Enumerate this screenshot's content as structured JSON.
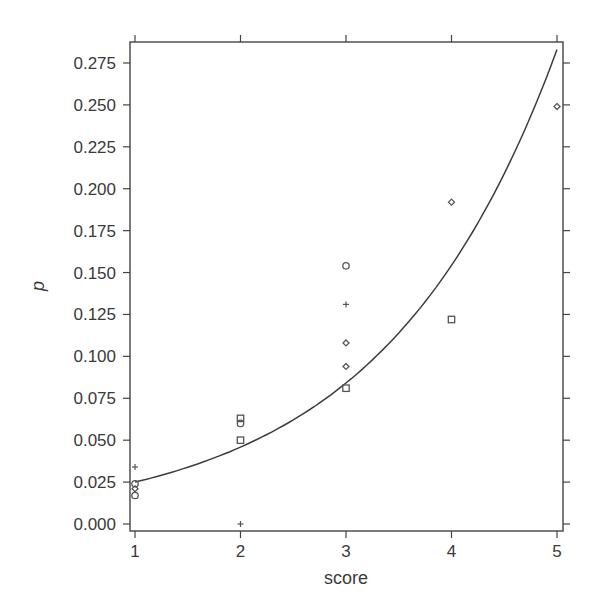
{
  "chart_data": {
    "type": "scatter",
    "title": "",
    "xlabel": "score",
    "ylabel": "p",
    "xlim": [
      0.97,
      5.05
    ],
    "ylim": [
      -0.004,
      0.288
    ],
    "x_ticks": [
      1,
      2,
      3,
      4,
      5
    ],
    "x_tick_labels": [
      "1",
      "2",
      "3",
      "4",
      "5"
    ],
    "y_ticks": [
      0.0,
      0.025,
      0.05,
      0.075,
      0.1,
      0.125,
      0.15,
      0.175,
      0.2,
      0.225,
      0.25,
      0.275
    ],
    "y_tick_labels": [
      "0.000",
      "0.025",
      "0.050",
      "0.075",
      "0.100",
      "0.125",
      "0.150",
      "0.175",
      "0.200",
      "0.225",
      "0.250",
      "0.275"
    ],
    "grid": false,
    "legend": null,
    "series": [
      {
        "name": "plus",
        "marker": "plus",
        "points": [
          {
            "x": 1,
            "y": 0.034
          },
          {
            "x": 2,
            "y": 0.0
          },
          {
            "x": 3,
            "y": 0.131
          }
        ]
      },
      {
        "name": "circle",
        "marker": "circle",
        "points": [
          {
            "x": 1,
            "y": 0.024
          },
          {
            "x": 1,
            "y": 0.017
          },
          {
            "x": 2,
            "y": 0.06
          },
          {
            "x": 3,
            "y": 0.154
          }
        ]
      },
      {
        "name": "square",
        "marker": "square",
        "points": [
          {
            "x": 2,
            "y": 0.063
          },
          {
            "x": 2,
            "y": 0.05
          },
          {
            "x": 3,
            "y": 0.081
          },
          {
            "x": 4,
            "y": 0.122
          }
        ]
      },
      {
        "name": "diamond",
        "marker": "diamond",
        "points": [
          {
            "x": 1,
            "y": 0.021
          },
          {
            "x": 3,
            "y": 0.108
          },
          {
            "x": 3,
            "y": 0.094
          },
          {
            "x": 4,
            "y": 0.192
          },
          {
            "x": 5,
            "y": 0.249
          }
        ]
      },
      {
        "name": "fitted curve",
        "type": "line",
        "points": [
          {
            "x": 1.0,
            "y": 0.025
          },
          {
            "x": 1.5,
            "y": 0.034
          },
          {
            "x": 2.0,
            "y": 0.048
          },
          {
            "x": 2.5,
            "y": 0.066
          },
          {
            "x": 3.0,
            "y": 0.09
          },
          {
            "x": 3.5,
            "y": 0.124
          },
          {
            "x": 4.0,
            "y": 0.17
          },
          {
            "x": 4.5,
            "y": 0.22
          },
          {
            "x": 5.0,
            "y": 0.283
          }
        ]
      }
    ]
  },
  "style": {
    "axis_color": "#444444",
    "marker_color": "#555555",
    "line_color": "#3c3c3c",
    "background": "#ffffff"
  }
}
